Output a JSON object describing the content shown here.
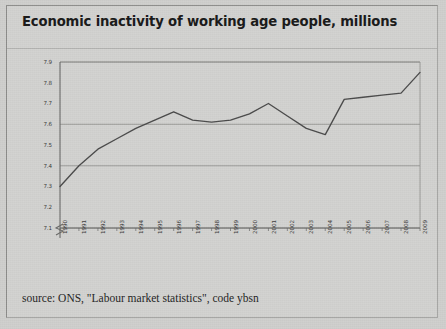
{
  "title": "Economic inactivity of working age people, millions",
  "caption": "source: ONS, \"Labour market statistics\", code ybsn",
  "colors": {
    "page_background": "#cfcfcd",
    "panel_background": "#d2d2d0",
    "title_text": "#181818",
    "line": "#4a4a4a",
    "axis": "#6a6a68",
    "gridline": "#8e8e8c",
    "tick_text": "#3a3a3a"
  },
  "chart_data": {
    "type": "line",
    "title": "Economic inactivity of working age people, millions",
    "xlabel": "",
    "ylabel": "",
    "ylim": [
      7.1,
      7.9
    ],
    "y_axis_break": true,
    "grid": true,
    "gridlines": [
      7.1,
      7.4,
      7.6,
      7.9
    ],
    "legend": "none",
    "ytick_labels": [
      "7.9",
      "7.8",
      "7.7",
      "7.6",
      "7.5",
      "7.4",
      "7.3",
      "7.2",
      "7.1"
    ],
    "ytick_values": [
      7.9,
      7.8,
      7.7,
      7.6,
      7.5,
      7.4,
      7.3,
      7.2,
      7.1
    ],
    "xtick_labels": [
      "1990",
      "1991",
      "1992",
      "1993",
      "1994",
      "1995",
      "1996",
      "1997",
      "1998",
      "1999",
      "2000",
      "2001",
      "2002",
      "2003",
      "2004",
      "2005",
      "2006",
      "2007",
      "2008",
      "2009"
    ],
    "x": [
      1990,
      1991,
      1992,
      1993,
      1994,
      1995,
      1996,
      1997,
      1998,
      1999,
      2000,
      2001,
      2002,
      2003,
      2004,
      2005,
      2006,
      2007,
      2008,
      2009
    ],
    "values": [
      7.3,
      7.4,
      7.48,
      7.53,
      7.58,
      7.62,
      7.66,
      7.62,
      7.61,
      7.62,
      7.65,
      7.7,
      7.64,
      7.58,
      7.55,
      7.72,
      7.73,
      7.74,
      7.75,
      7.85
    ],
    "series": [
      {
        "name": "Economic inactivity",
        "values": [
          7.3,
          7.4,
          7.48,
          7.53,
          7.58,
          7.62,
          7.66,
          7.62,
          7.61,
          7.62,
          7.65,
          7.7,
          7.64,
          7.58,
          7.55,
          7.72,
          7.73,
          7.74,
          7.75,
          7.85
        ]
      }
    ]
  }
}
